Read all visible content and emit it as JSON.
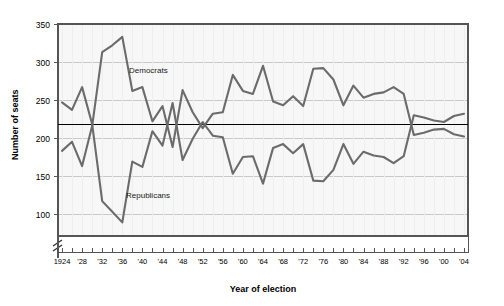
{
  "chart": {
    "title": "",
    "y_axis_label": "Number of seats",
    "x_axis_label": "Year of election",
    "y_ticks": [
      "350",
      "300",
      "250",
      "200",
      "150",
      "100"
    ],
    "x_ticks": [
      "1924",
      "'28",
      "'32",
      "'36",
      "'40",
      "'44",
      "'48",
      "'52",
      "'56",
      "'60",
      "'64",
      "'68",
      "'72",
      "'76",
      "'80",
      "'84",
      "'88",
      "'92",
      "'96",
      "'00",
      "'04"
    ],
    "series_labels": {
      "democrats": "Democrats",
      "republicans": "Republicans"
    },
    "colors": {
      "democrat_line": "#6b6b6b",
      "republican_line": "#6b6b6b",
      "majority_line": "#000000",
      "grid": "#c9c9c9",
      "plot_bg": "#f7f7f7",
      "frame": "#555555",
      "text": "#000000"
    },
    "axis_break_symbol": "≠"
  },
  "chart_data": {
    "type": "line",
    "title": "",
    "xlabel": "Year of election",
    "ylabel": "Number of seats",
    "ylim": [
      80,
      350
    ],
    "xlim": [
      1924,
      2004
    ],
    "grid": true,
    "legend": "inline-annotations",
    "y_tick_values": [
      350,
      300,
      250,
      200,
      150,
      100
    ],
    "x_tick_labels": [
      "1924",
      "'28",
      "'32",
      "'36",
      "'40",
      "'44",
      "'48",
      "'52",
      "'56",
      "'60",
      "'64",
      "'68",
      "'72",
      "'76",
      "'80",
      "'84",
      "'88",
      "'92",
      "'96",
      "'00",
      "'04"
    ],
    "x": [
      1924,
      1926,
      1928,
      1930,
      1932,
      1934,
      1936,
      1938,
      1940,
      1942,
      1944,
      1946,
      1948,
      1950,
      1952,
      1954,
      1956,
      1958,
      1960,
      1962,
      1964,
      1966,
      1968,
      1970,
      1972,
      1974,
      1976,
      1978,
      1980,
      1982,
      1984,
      1986,
      1988,
      1990,
      1992,
      1994,
      1996,
      1998,
      2000,
      2002,
      2004
    ],
    "annotations": [
      {
        "text": "Majority line (218 seats)",
        "y": 218,
        "type": "horizontal-rule"
      },
      {
        "text": "Democrats",
        "x": 1936,
        "y": 287
      },
      {
        "text": "Republicans",
        "x": 1937,
        "y": 130
      }
    ],
    "series": [
      {
        "name": "Democrats",
        "color": "#6b6b6b",
        "values": [
          183,
          195,
          163,
          216,
          313,
          322,
          333,
          262,
          267,
          222,
          242,
          188,
          263,
          234,
          213,
          232,
          234,
          283,
          262,
          258,
          295,
          248,
          243,
          255,
          242,
          291,
          292,
          277,
          243,
          269,
          253,
          258,
          260,
          267,
          258,
          204,
          207,
          211,
          212,
          205,
          202
        ]
      },
      {
        "name": "Republicans",
        "color": "#6b6b6b",
        "values": [
          247,
          237,
          267,
          218,
          117,
          103,
          89,
          169,
          162,
          209,
          190,
          246,
          171,
          199,
          221,
          203,
          201,
          153,
          175,
          176,
          140,
          187,
          192,
          180,
          192,
          144,
          143,
          158,
          192,
          166,
          182,
          177,
          175,
          167,
          176,
          230,
          227,
          223,
          221,
          229,
          232
        ]
      }
    ]
  }
}
